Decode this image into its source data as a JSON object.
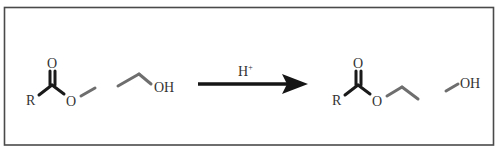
{
  "diagram": {
    "type": "chemical-reaction-scheme",
    "colors": {
      "frame": "#4a4a4a",
      "dark_bond": "#1a1a1a",
      "grey_bond": "#6e6e6e",
      "text": "#333333",
      "arrow": "#151515",
      "background": "#ffffff"
    },
    "reactants": {
      "ester": {
        "r_label": "R",
        "carbonyl_o_label": "O",
        "ester_o_label": "O"
      },
      "alcohol": {
        "oh_label": "OH"
      }
    },
    "arrow": {
      "catalyst_label": "H",
      "catalyst_charge": "+"
    },
    "products": {
      "ester": {
        "r_label": "R",
        "carbonyl_o_label": "O",
        "ester_o_label": "O"
      },
      "alcohol": {
        "oh_label": "OH"
      }
    }
  }
}
